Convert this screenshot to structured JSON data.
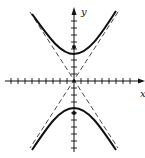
{
  "diagram": {
    "type": "hyperbola",
    "orientation": "vertical",
    "axis_labels": {
      "x": "x",
      "y": "y"
    },
    "colors": {
      "curve": "#111111",
      "asymptote": "#333333",
      "axis": "#111111"
    },
    "features": [
      "two branches (upper and lower)",
      "dashed asymptotes through origin",
      "foci marked on y-axis",
      "tick marks on both axes"
    ]
  }
}
